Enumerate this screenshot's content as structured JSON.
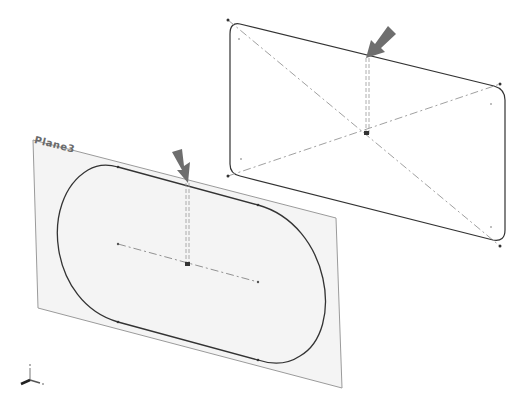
{
  "viewport": {
    "plane_label": "Plane3",
    "triad_axes": [
      "x",
      "y",
      "z"
    ]
  },
  "colors": {
    "background": "#ffffff",
    "plane_fill": "#f4f4f4",
    "plane_edge": "#8a8a8a",
    "sketch_line": "#333333",
    "centerline": "#777777",
    "arrow": "#6e6e6e"
  },
  "annotations": {
    "front_arrow": "arrow-pointing-to-slot-sketch",
    "rear_arrow": "arrow-pointing-to-rectangle-sketch"
  }
}
